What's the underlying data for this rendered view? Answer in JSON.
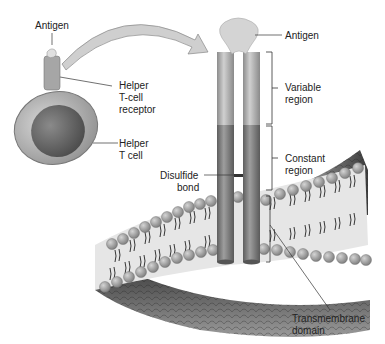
{
  "diagram": {
    "labels": {
      "antigen_left": "Antigen",
      "helper_tcell_receptor_line1": "Helper",
      "helper_tcell_receptor_line2": "T-cell",
      "helper_tcell_receptor_line3": "receptor",
      "helper_tcell_line1": "Helper",
      "helper_tcell_line2": "T cell",
      "antigen_right": "Antigen",
      "variable_region_line1": "Variable",
      "variable_region_line2": "region",
      "constant_region_line1": "Constant",
      "constant_region_line2": "region",
      "disulfide_bond_line1": "Disulfide",
      "disulfide_bond_line2": "bond",
      "transmembrane_line1": "Transmembrane",
      "transmembrane_line2": "domain"
    },
    "colors": {
      "receptor_light": "#b5b5b5",
      "receptor_dark": "#7a7a7a",
      "membrane_head": "#9a9a9a",
      "membrane_dark": "#3a3a3a",
      "cell_outer": "#a8a8a8",
      "nucleus": "#6e6e6e"
    }
  }
}
